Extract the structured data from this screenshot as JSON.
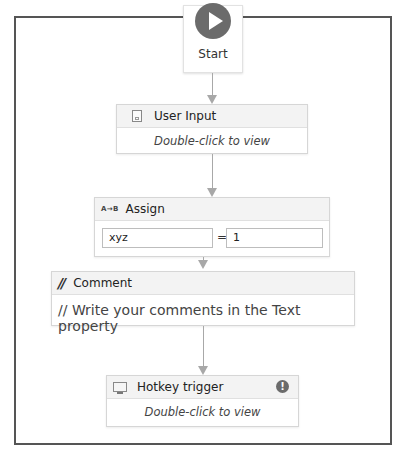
{
  "start": {
    "label": "Start",
    "icon": "play-icon"
  },
  "activities": [
    {
      "id": "user-input",
      "title": "User Input",
      "icon": "document-icon",
      "body": "Double-click to view"
    },
    {
      "id": "assign",
      "title": "Assign",
      "icon": "assign-icon",
      "icon_text": "A→B",
      "to_value": "xyz",
      "operator": "=",
      "value": "1"
    },
    {
      "id": "comment",
      "title": "Comment",
      "icon": "comment-icon",
      "icon_text": "//",
      "body": "// Write your comments in the Text property"
    },
    {
      "id": "hotkey-trigger",
      "title": "Hotkey trigger",
      "icon": "monitor-icon",
      "body": "Double-click to view",
      "warning_icon": "!"
    }
  ]
}
